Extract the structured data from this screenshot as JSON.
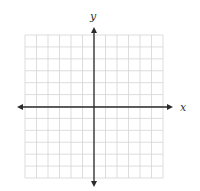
{
  "diagram": {
    "type": "coordinate-grid",
    "title": "",
    "x_axis_label": "x",
    "y_axis_label": "y",
    "grid": {
      "columns": 12,
      "rows": 12,
      "left": 25,
      "top": 35,
      "right": 163,
      "bottom": 178,
      "line_color": "#d4d4d4"
    },
    "axes": {
      "origin_px": [
        94,
        107
      ],
      "x_start": 17,
      "x_end": 173,
      "y_start": 27,
      "y_end": 187,
      "color": "#2b2b2b"
    },
    "arrows": [
      "left",
      "right",
      "up",
      "down"
    ],
    "tick_labels": []
  }
}
